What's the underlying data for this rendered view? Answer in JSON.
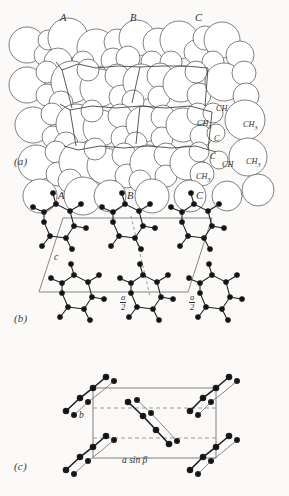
{
  "figure": {
    "background": "#fbfaf8",
    "ink": "#3a3a3a",
    "atom_fill": "#111111",
    "panels": [
      {
        "id": "a",
        "label": "(a)",
        "type": "space-filling-packing-model",
        "site_labels": [
          {
            "text": "A",
            "x": 60,
            "y": 12
          },
          {
            "text": "B",
            "x": 130,
            "y": 12
          },
          {
            "text": "C",
            "x": 195,
            "y": 12
          }
        ],
        "atom_labels": [
          {
            "text": "CH",
            "sub": "",
            "x": 216,
            "y": 104
          },
          {
            "text": "CH",
            "sub": "3",
            "x": 197,
            "y": 119
          },
          {
            "text": "CH",
            "sub": "3",
            "x": 243,
            "y": 120
          },
          {
            "text": "C",
            "sub": "",
            "x": 214,
            "y": 134
          },
          {
            "text": "C",
            "sub": "",
            "x": 210,
            "y": 152
          },
          {
            "text": "CH",
            "sub": "",
            "x": 222,
            "y": 160
          },
          {
            "text": "CH",
            "sub": "3",
            "x": 246,
            "y": 157
          },
          {
            "text": "CH",
            "sub": "3",
            "x": 196,
            "y": 172
          }
        ]
      },
      {
        "id": "b",
        "label": "(b)",
        "type": "unit-cell-projection",
        "site_labels": [
          {
            "text": "A",
            "x": 58,
            "y": 196
          },
          {
            "text": "B",
            "x": 127,
            "y": 196
          },
          {
            "text": "C",
            "x": 196,
            "y": 196
          }
        ],
        "axis_labels": [
          {
            "text": "c",
            "x": 54,
            "y": 258
          }
        ],
        "fraction_labels": [
          {
            "num": "a",
            "den": "2",
            "x": 123,
            "y": 300
          },
          {
            "num": "a",
            "den": "2",
            "x": 192,
            "y": 300
          }
        ]
      },
      {
        "id": "c",
        "label": "(c)",
        "type": "chain-end-on-projection",
        "axis_labels": [
          {
            "text": "b",
            "x": 80,
            "y": 415
          },
          {
            "text": "a sin β",
            "x": 127,
            "y": 459
          }
        ]
      }
    ]
  }
}
